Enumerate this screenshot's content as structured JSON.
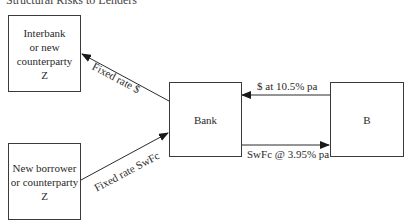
{
  "caption": "Structural Risks to Lenders",
  "nodes": {
    "interbank": "Interbank\nor new\ncounterparty\nZ",
    "borrower": "New borrower\nor counterparty\nZ",
    "bank": "Bank",
    "b": "B"
  },
  "edges": {
    "bank_to_interbank": "Fixed rate $",
    "borrower_to_bank": "Fixed rate SwFc",
    "b_to_bank": "$ at 10.5% pa",
    "bank_to_b": "SwFc @ 3.95% pa"
  }
}
